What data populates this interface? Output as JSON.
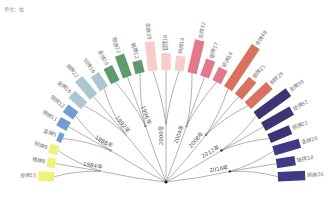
{
  "header": {
    "unit_label": "单位：枚"
  },
  "chart_data": {
    "type": "bar",
    "layout": "radial-semicircle",
    "title": "",
    "unit": "枚",
    "center": [
      166,
      182
    ],
    "inner_radius": 112,
    "scale_px_per_unit": 1.05,
    "groups": [
      {
        "year": "1984年",
        "color": "#eef27a",
        "dot_color": "#f2f2b0",
        "medals": [
          {
            "type": "金牌",
            "value": 15
          },
          {
            "type": "银牌",
            "value": 8
          },
          {
            "type": "铜牌",
            "value": 9
          }
        ]
      },
      {
        "year": "1988年",
        "color": "#6f9fd2",
        "dot_color": "#6f9fd2",
        "medals": [
          {
            "type": "金牌",
            "value": 5
          },
          {
            "type": "银牌",
            "value": 11
          },
          {
            "type": "铜牌",
            "value": 12
          }
        ]
      },
      {
        "year": "1992年",
        "color": "#abc7cf",
        "dot_color": "#abc7cf",
        "medals": [
          {
            "type": "金牌",
            "value": 16
          },
          {
            "type": "银牌",
            "value": 22
          },
          {
            "type": "铜牌",
            "value": 16
          }
        ]
      },
      {
        "year": "1996年",
        "color": "#5f9a6c",
        "dot_color": "#5f9a6c",
        "medals": [
          {
            "type": "金牌",
            "value": 16
          },
          {
            "type": "银牌",
            "value": 22
          },
          {
            "type": "铜牌",
            "value": 12
          }
        ]
      },
      {
        "year": "2000年",
        "color": "#f8cccc",
        "dot_color": "#f8cccc",
        "medals": [
          {
            "type": "金牌",
            "value": 28
          },
          {
            "type": "银牌",
            "value": 16
          },
          {
            "type": "铜牌",
            "value": 14
          }
        ]
      },
      {
        "year": "2004年",
        "color": "#e2788a",
        "dot_color": "#e2788a",
        "medals": [
          {
            "type": "金牌",
            "value": 32
          },
          {
            "type": "银牌",
            "value": 17
          },
          {
            "type": "铜牌",
            "value": 14
          }
        ]
      },
      {
        "year": "2008年",
        "color": "#d9715f",
        "dot_color": "#d9434a",
        "medals": [
          {
            "type": "金牌",
            "value": 48
          },
          {
            "type": "银牌",
            "value": 21
          },
          {
            "type": "铜牌",
            "value": 28
          }
        ]
      },
      {
        "year": "2012年",
        "color": "#3e3474",
        "dot_color": "#2d2a4e",
        "medals": [
          {
            "type": "金牌",
            "value": 38
          },
          {
            "type": "银牌",
            "value": 31
          },
          {
            "type": "铜牌",
            "value": 22
          }
        ]
      },
      {
        "year": "2016年",
        "color": "#3e3a86",
        "dot_color": "#2d2a4e",
        "medals": [
          {
            "type": "金牌",
            "value": 26
          },
          {
            "type": "银牌",
            "value": 18
          },
          {
            "type": "铜牌",
            "value": 26
          }
        ]
      }
    ]
  }
}
